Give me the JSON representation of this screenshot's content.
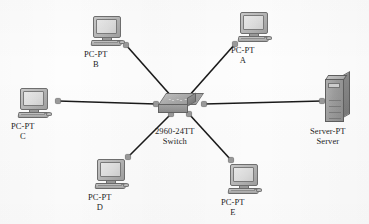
{
  "diagram": {
    "background_color": "#fdfdfd",
    "line_color": "#1a1a1a",
    "connector_color": "#9a9a9a",
    "label_color": "#1d1d1d"
  },
  "nodes": [
    {
      "id": "pc-b",
      "type": "pc",
      "device_label": "PC-PT",
      "name_label": "B",
      "icon": "pc-icon",
      "x": 91,
      "y": 16,
      "label_x": 84,
      "label_y": 50
    },
    {
      "id": "pc-a",
      "type": "pc",
      "device_label": "PC-PT",
      "name_label": "A",
      "icon": "pc-icon",
      "x": 238,
      "y": 12,
      "label_x": 231,
      "label_y": 46
    },
    {
      "id": "pc-c",
      "type": "pc",
      "device_label": "PC-PT",
      "name_label": "C",
      "icon": "pc-icon",
      "x": 18,
      "y": 88,
      "label_x": 11,
      "label_y": 122
    },
    {
      "id": "pc-d",
      "type": "pc",
      "device_label": "PC-PT",
      "name_label": "D",
      "icon": "pc-icon",
      "x": 95,
      "y": 159,
      "label_x": 88,
      "label_y": 193
    },
    {
      "id": "pc-e",
      "type": "pc",
      "device_label": "PC-PT",
      "name_label": "E",
      "icon": "pc-icon",
      "x": 228,
      "y": 164,
      "label_x": 221,
      "label_y": 198
    },
    {
      "id": "switch-1",
      "type": "switch",
      "device_label": "2960-24TT",
      "name_label": "Switch",
      "icon": "switch-icon",
      "x": 158,
      "y": 93,
      "label_x": 155,
      "label_y": 127
    },
    {
      "id": "server-1",
      "type": "server",
      "device_label": "Server-PT",
      "name_label": "Server",
      "icon": "server-icon",
      "x": 325,
      "y": 75,
      "label_x": 310,
      "label_y": 127
    }
  ],
  "links": [
    {
      "id": "link-switch-pc-b",
      "from": "switch-1",
      "to": "pc-b",
      "x1": 172,
      "y1": 97,
      "x2": 126,
      "y2": 45
    },
    {
      "id": "link-switch-pc-a",
      "from": "switch-1",
      "to": "pc-a",
      "x1": 188,
      "y1": 97,
      "x2": 235,
      "y2": 44
    },
    {
      "id": "link-switch-pc-c",
      "from": "switch-1",
      "to": "pc-c",
      "x1": 156,
      "y1": 104,
      "x2": 58,
      "y2": 101
    },
    {
      "id": "link-switch-server",
      "from": "switch-1",
      "to": "server-1",
      "x1": 204,
      "y1": 104,
      "x2": 322,
      "y2": 101
    },
    {
      "id": "link-switch-pc-d",
      "from": "switch-1",
      "to": "pc-d",
      "x1": 171,
      "y1": 114,
      "x2": 128,
      "y2": 157
    },
    {
      "id": "link-switch-pc-e",
      "from": "switch-1",
      "to": "pc-e",
      "x1": 189,
      "y1": 114,
      "x2": 231,
      "y2": 160
    }
  ]
}
